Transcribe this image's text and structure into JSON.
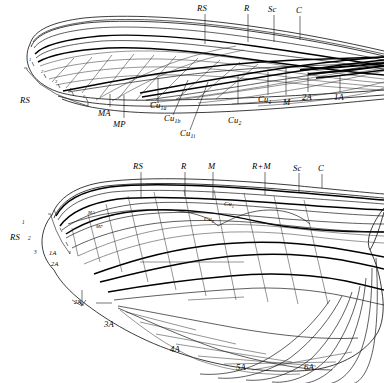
{
  "figure": {
    "panels": [
      {
        "id": "upper-wing",
        "name": "Upper wing (fore wing) venation",
        "top_labels": [
          "RS",
          "R",
          "Sc",
          "C"
        ],
        "bottom_labels": [
          "MA",
          "MP",
          "Cu1a",
          "Cu1b",
          "Cu1i",
          "Cu2",
          "Cu1",
          "M",
          "2A",
          "1A"
        ],
        "bracket_label": "RS",
        "bracket_numbers": [
          "1",
          "2",
          "3",
          "4",
          "5"
        ]
      },
      {
        "id": "lower-wing",
        "name": "Lower wing (hind wing) venation",
        "top_labels": [
          "RS",
          "R",
          "M",
          "R+M",
          "Sc",
          "C"
        ],
        "inner_labels": [
          "MA",
          "MP",
          "Cu1",
          "Cu2"
        ],
        "left_labels": [
          "1A",
          "2A",
          "2Aa"
        ],
        "anal_labels": [
          "3A",
          "4A",
          "5A",
          "6A"
        ],
        "bracket_label": "RS",
        "bracket_numbers": [
          "1",
          "2",
          "3"
        ]
      }
    ]
  },
  "upper": {
    "t1": "RS",
    "t2": "R",
    "t3": "Sc",
    "t4": "C",
    "rs_bracket": "RS",
    "n1": "1",
    "n2": "2",
    "n3": "3",
    "n4": "4",
    "n5": "5",
    "ma": "MA",
    "mp": "MP",
    "cu1a_main": "Cu",
    "cu1a_sub": "1a",
    "cu1b_main": "Cu",
    "cu1b_sub": "1b",
    "cu1i_main": "Cu",
    "cu1i_sub": "1i",
    "cu2_main": "Cu",
    "cu2_sub": "2",
    "cu1_main": "Cu",
    "cu1_sub": "1",
    "m": "M",
    "a2": "2A",
    "a1": "1A"
  },
  "lower": {
    "t1": "RS",
    "t2": "R",
    "t3": "M",
    "t4": "R+M",
    "t5": "Sc",
    "t6": "C",
    "rs_bracket": "RS",
    "n1": "1",
    "n2": "2",
    "n3": "3",
    "ma": "MA",
    "mp": "MP",
    "cu1_main": "Cu",
    "cu1_sub": "1",
    "cu2_main": "Cu",
    "cu2_sub": "2",
    "a1": "1A",
    "a2": "2A",
    "a2a_main": "2A",
    "a2a_sub": "a",
    "a3": "3A",
    "a4": "4A",
    "a5": "5A",
    "a6": "6A"
  },
  "colors": {
    "ink": "#1a1a1a",
    "background": "#ffffff"
  }
}
